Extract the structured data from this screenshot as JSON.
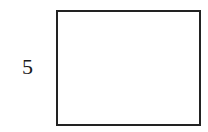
{
  "diagram": {
    "shape": "rectangle",
    "labels": {
      "left_side": "5"
    },
    "colors": {
      "stroke": "#222222",
      "fill": "#ffffff",
      "text": "#1a1a1a"
    }
  }
}
